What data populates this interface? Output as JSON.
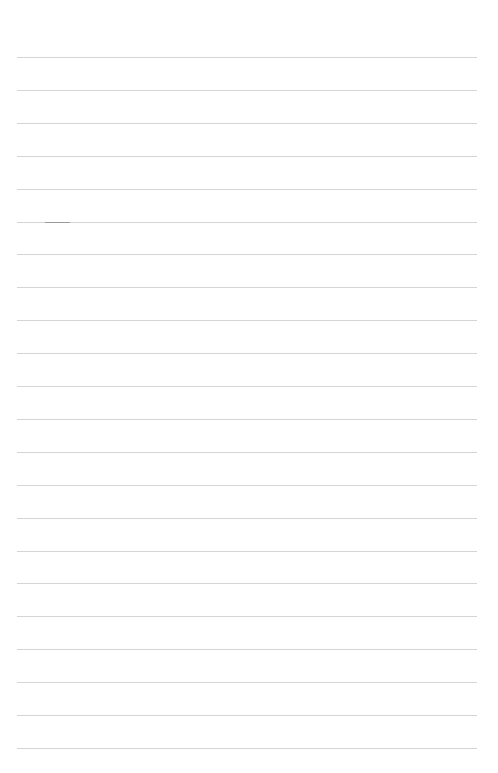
{
  "page": {
    "type": "blank lined paper",
    "line_count": 22,
    "first_line_y": 57,
    "line_spacing": 32.9,
    "line_left": 17,
    "line_width": 460,
    "line_color": "#d4d4d4",
    "background": "#ffffff",
    "mark": {
      "line_index": 5,
      "left": 45,
      "width": 25,
      "color": "#9a9a9a"
    }
  }
}
